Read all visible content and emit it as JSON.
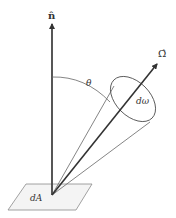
{
  "diagram": {
    "labels": {
      "normal": "n̂",
      "direction": "Ω̂",
      "angle": "θ",
      "solid_angle": "dω",
      "area": "dA"
    },
    "colors": {
      "line": "#444444",
      "thin_line": "#666666",
      "patch_fill": "#f4f4f4",
      "patch_stroke": "#888888"
    }
  }
}
